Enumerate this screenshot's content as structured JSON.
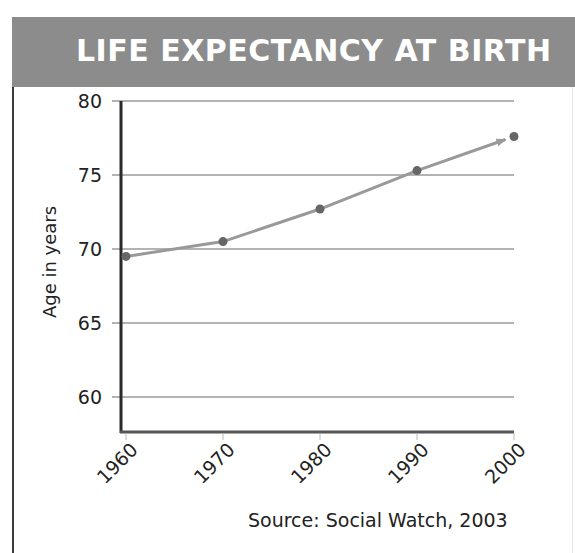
{
  "header": {
    "title": "LIFE EXPECTANCY AT BIRTH",
    "background_color": "#8c8c8c",
    "title_color": "#ffffff"
  },
  "axes": {
    "y_label": "Age in years",
    "y_ticks": [
      "80",
      "75",
      "70",
      "65",
      "60"
    ],
    "x_ticks": [
      "1960",
      "1970",
      "1980",
      "1990",
      "2000"
    ]
  },
  "source": "Source: Social Watch, 2003",
  "chart_data": {
    "type": "line",
    "title": "LIFE EXPECTANCY AT BIRTH",
    "xlabel": "",
    "ylabel": "Age in years",
    "categories": [
      "1960",
      "1970",
      "1980",
      "1990",
      "2000"
    ],
    "series": [
      {
        "name": "Life expectancy at birth",
        "values": [
          69.5,
          70.5,
          72.7,
          75.3,
          77.6
        ],
        "color": "#999999",
        "marker_color": "#666666"
      }
    ],
    "ylim": [
      58,
      80
    ],
    "yticks": [
      60,
      65,
      70,
      75,
      80
    ],
    "grid": true,
    "legend": "none",
    "annotations": [
      "Arrowhead at end of line toward 2000",
      "Source: Social Watch, 2003"
    ]
  }
}
